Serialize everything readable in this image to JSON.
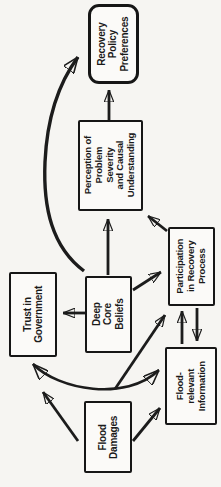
{
  "diagram": {
    "nodes": {
      "recovery": {
        "label": "Recovery\nPolicy\nPreferences",
        "shape": "rounded-rectangle"
      },
      "perception": {
        "label": "Perception of\nProblem Severity\nand Causal\nUnderstanding",
        "shape": "rectangle"
      },
      "trust": {
        "label": "Trust in\nGovernment",
        "shape": "rectangle"
      },
      "deep_core": {
        "label": "Deep Core\nBeliefs",
        "shape": "rectangle"
      },
      "participation": {
        "label": "Participation\nin Recovery\nProcess",
        "shape": "rectangle"
      },
      "flood_info": {
        "label": "Flood-\nrelevant\nInformation",
        "shape": "rectangle"
      },
      "flood_damages": {
        "label": "Flood\nDamages",
        "shape": "rectangle"
      }
    },
    "edges": [
      {
        "from": "Perception of Problem Severity and Causal Understanding",
        "to": "Recovery Policy Preferences",
        "style": "straight"
      },
      {
        "from": "Deep Core Beliefs",
        "to": "Recovery Policy Preferences",
        "style": "curved"
      },
      {
        "from": "Deep Core Beliefs",
        "to": "Trust in Government",
        "style": "straight"
      },
      {
        "from": "Deep Core Beliefs",
        "to": "Perception of Problem Severity and Causal Understanding",
        "style": "straight"
      },
      {
        "from": "Deep Core Beliefs",
        "to": "Participation in Recovery Process",
        "style": "straight"
      },
      {
        "from": "Participation in Recovery Process",
        "to": "Perception of Problem Severity and Causal Understanding",
        "style": "straight"
      },
      {
        "from": "Flood-relevant Information",
        "to": "Participation in Recovery Process",
        "style": "straight-reciprocal-pair"
      },
      {
        "from": "Participation in Recovery Process",
        "to": "Flood-relevant Information",
        "style": "straight-reciprocal-pair"
      },
      {
        "from": "Flood Damages",
        "to": "Participation in Recovery Process",
        "style": "straight"
      },
      {
        "from": "Trust in Government",
        "to": "Flood-relevant Information",
        "style": "curved-double-headed"
      },
      {
        "from": "Flood Damages",
        "to": "Trust in Government",
        "style": "straight"
      },
      {
        "from": "Flood Damages",
        "to": "Flood-relevant Information",
        "style": "straight"
      }
    ],
    "colors": {
      "ink": "#1c1c1c",
      "paper": "#f6f5f2",
      "box_fill": "#fbfaf8"
    }
  }
}
